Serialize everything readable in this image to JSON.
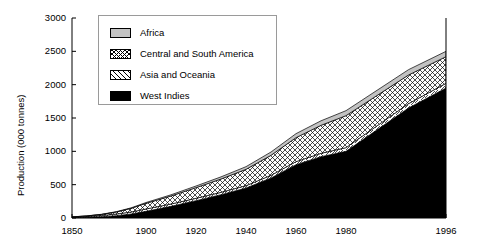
{
  "chart_data": {
    "type": "area",
    "stacked": true,
    "title": "",
    "xlabel": "",
    "ylabel": "Production (000 tonnes)",
    "ylim": [
      0,
      3000
    ],
    "yticks": [
      0,
      500,
      1000,
      1500,
      2000,
      2500,
      3000
    ],
    "ytick_labels": [
      "0",
      "500",
      "1000",
      "1500",
      "2000",
      "2500",
      "3000"
    ],
    "xticks": [
      1850,
      1900,
      1920,
      1940,
      1960,
      1980,
      1996
    ],
    "xtick_labels": [
      "1850",
      "1900",
      "1920",
      "1940",
      "1960",
      "1980",
      "1996"
    ],
    "xlim": [
      1850,
      1996
    ],
    "grid": false,
    "legend_position": "top-center",
    "x": [
      1850,
      1860,
      1870,
      1880,
      1890,
      1900,
      1910,
      1920,
      1930,
      1940,
      1950,
      1960,
      1970,
      1980,
      1990,
      1996
    ],
    "series": [
      {
        "name": "West Indies",
        "fill": "solid-black",
        "color": "#000000",
        "values": [
          5,
          10,
          20,
          35,
          60,
          100,
          175,
          260,
          350,
          450,
          600,
          800,
          920,
          1000,
          1650,
          1950
        ]
      },
      {
        "name": "Asia and Oceania",
        "fill": "diagonal-hatch",
        "color": "#ffffff",
        "values": [
          8,
          12,
          18,
          25,
          30,
          35,
          35,
          35,
          35,
          35,
          40,
          45,
          50,
          55,
          65,
          70
        ]
      },
      {
        "name": "Central and South America",
        "fill": "cross-hatch",
        "color": "#ffffff",
        "values": [
          3,
          8,
          15,
          30,
          55,
          85,
          120,
          160,
          200,
          245,
          300,
          360,
          420,
          480,
          430,
          400
        ]
      },
      {
        "name": "Africa",
        "fill": "solid-gray",
        "color": "#c3c3c3",
        "values": [
          1,
          2,
          3,
          5,
          8,
          12,
          18,
          25,
          32,
          40,
          50,
          60,
          68,
          75,
          80,
          80
        ]
      }
    ],
    "totals": [
      17,
      32,
      56,
      95,
      153,
      232,
      348,
      480,
      617,
      770,
      990,
      1265,
      1458,
      1610,
      2225,
      2500
    ]
  },
  "legend": {
    "items": [
      {
        "label": "Africa",
        "swatch": "solid-gray"
      },
      {
        "label": "Central and South America",
        "swatch": "cross-hatch"
      },
      {
        "label": "Asia and Oceania",
        "swatch": "diagonal-hatch"
      },
      {
        "label": "West Indies",
        "swatch": "solid-black"
      }
    ]
  }
}
